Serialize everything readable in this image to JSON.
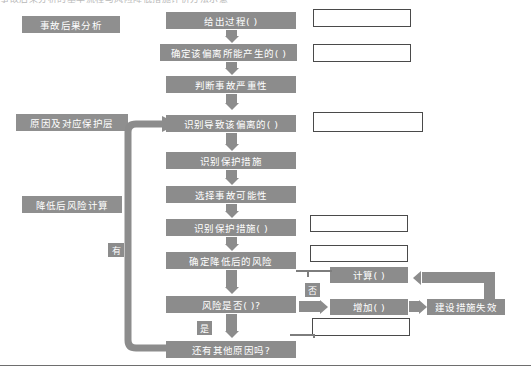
{
  "page": {
    "top_cut_text": "事故后果分析的基本流程与风险降低措施评价方法示意",
    "width": 531,
    "height": 372,
    "colors": {
      "box_fill": "#8c8c8c",
      "box_text": "#ffffff",
      "white_box_border": "#4a4a4a",
      "arrow": "#8c8c8c",
      "rule": "#6e6e6e",
      "background": "#ffffff"
    }
  },
  "stages": [
    {
      "id": "stage-consequence",
      "label": "事故后果分析"
    },
    {
      "id": "stage-cause-protection",
      "label": "原因及对应保护层"
    },
    {
      "id": "stage-residual-risk",
      "label": "降低后风险计算"
    }
  ],
  "flow": {
    "nodes": [
      {
        "id": "node-give-process",
        "label": "给出过程(     )"
      },
      {
        "id": "node-determine-deviation",
        "label": "确定该偏离所能产生的(    )"
      },
      {
        "id": "node-judge-severity",
        "label": "判断事故严重性"
      },
      {
        "id": "node-identify-cause",
        "label": "识别导致该偏离的(    )"
      },
      {
        "id": "node-identify-protection",
        "label": "识别保护措施"
      },
      {
        "id": "node-select-likelihood",
        "label": "选择事故可能性"
      },
      {
        "id": "node-identify-protection2",
        "label": "识别保护措施(    )"
      },
      {
        "id": "node-determine-residual",
        "label": "确定降低后的风险"
      },
      {
        "id": "node-risk-decision",
        "label": "风险是否(     )?"
      },
      {
        "id": "node-other-causes",
        "label": "还有其他原因吗?"
      }
    ],
    "side_nodes": [
      {
        "id": "node-calculate",
        "label": "计算(    )"
      },
      {
        "id": "node-increase",
        "label": "增加(    )"
      },
      {
        "id": "node-measure-failure",
        "label": "建设措施失效"
      }
    ],
    "tags": [
      {
        "id": "tag-has",
        "label": "有"
      },
      {
        "id": "tag-yes",
        "label": "是"
      },
      {
        "id": "tag-no",
        "label": "否"
      }
    ],
    "annotation_boxes": [
      {
        "id": "annotation-box-1",
        "value": ""
      },
      {
        "id": "annotation-box-2",
        "value": ""
      },
      {
        "id": "annotation-box-3",
        "value": ""
      },
      {
        "id": "annotation-box-4",
        "value": ""
      },
      {
        "id": "annotation-box-5",
        "value": ""
      },
      {
        "id": "annotation-box-6",
        "value": ""
      }
    ]
  }
}
